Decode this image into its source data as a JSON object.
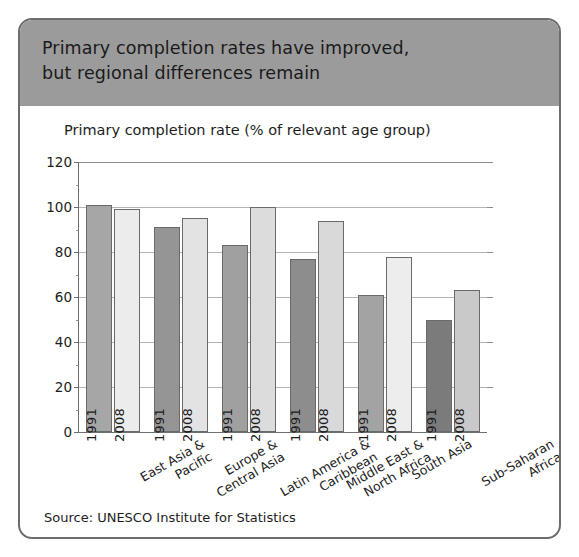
{
  "card": {
    "title_line1": "Primary completion rates have improved,",
    "title_line2": "but regional differences remain",
    "source": "Source: UNESCO Institute for Statistics",
    "banner_color": "#9b9b9b",
    "border_color": "#6d6d6d"
  },
  "chart_data": {
    "type": "bar",
    "title": "Primary completion rates have improved, but regional differences remain",
    "ylabel": "Primary completion rate (% of relevant age group)",
    "xlabel": "",
    "ylim": [
      0,
      120
    ],
    "yticks": [
      0,
      20,
      40,
      60,
      80,
      100,
      120
    ],
    "grid": true,
    "legend": "none",
    "bar_value_labels": "year printed vertically inside each bar",
    "categories": [
      "East Asia &\nPacific",
      "Europe &\nCentral Asia",
      "Latin America &\nCaribbean",
      "Middle East &\nNorth Africa",
      "South Asia",
      "Sub-Saharan\nAfrica"
    ],
    "categories_flat": [
      "East Asia & Pacific",
      "Europe & Central Asia",
      "Latin America & Caribbean",
      "Middle East & North Africa",
      "South Asia",
      "Sub-Saharan Africa"
    ],
    "series": [
      {
        "name": "1991",
        "color": "#9c9c9c",
        "values": [
          101,
          91,
          83,
          77,
          61,
          50
        ]
      },
      {
        "name": "2008",
        "color": "#e9e9e9",
        "values": [
          99,
          95,
          100,
          94,
          78,
          63
        ]
      }
    ],
    "bars": [
      {
        "category": "East Asia & Pacific",
        "year": "1991",
        "value": 101,
        "color": "#a6a6a6"
      },
      {
        "category": "East Asia & Pacific",
        "year": "2008",
        "value": 99,
        "color": "#ececec"
      },
      {
        "category": "Europe & Central Asia",
        "year": "1991",
        "value": 91,
        "color": "#959595"
      },
      {
        "category": "Europe & Central Asia",
        "year": "2008",
        "value": 95,
        "color": "#e3e3e3"
      },
      {
        "category": "Latin America & Caribbean",
        "year": "1991",
        "value": 83,
        "color": "#a0a0a0"
      },
      {
        "category": "Latin America & Caribbean",
        "year": "2008",
        "value": 100,
        "color": "#dcdcdc"
      },
      {
        "category": "Middle East & North Africa",
        "year": "1991",
        "value": 77,
        "color": "#8d8d8d"
      },
      {
        "category": "Middle East & North Africa",
        "year": "2008",
        "value": 94,
        "color": "#d9d9d9"
      },
      {
        "category": "South Asia",
        "year": "1991",
        "value": 61,
        "color": "#a3a3a3"
      },
      {
        "category": "South Asia",
        "year": "2008",
        "value": 78,
        "color": "#ededed"
      },
      {
        "category": "Sub-Saharan Africa",
        "year": "1991",
        "value": 50,
        "color": "#7b7b7b"
      },
      {
        "category": "Sub-Saharan Africa",
        "year": "2008",
        "value": 63,
        "color": "#c9c9c9"
      }
    ]
  }
}
